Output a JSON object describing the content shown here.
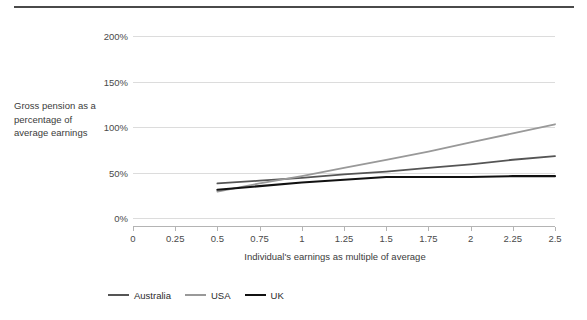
{
  "chart_data": {
    "type": "line",
    "title": "",
    "subtitle": "",
    "xlabel": "Individual's earnings as multiple of average",
    "ylabel": "Gross pension as a percentage of average earnings",
    "x": [
      0.5,
      0.75,
      1,
      1.25,
      1.5,
      1.75,
      2,
      2.25,
      2.5
    ],
    "xlim": [
      0,
      2.5
    ],
    "ylim": [
      0,
      200
    ],
    "xticks": [
      "0",
      "0.25",
      "0.5",
      "0.75",
      "1",
      "1.25",
      "1.5",
      "1.75",
      "2",
      "2.25",
      "2.5"
    ],
    "xtick_values": [
      0,
      0.25,
      0.5,
      0.75,
      1,
      1.25,
      1.5,
      1.75,
      2,
      2.25,
      2.5
    ],
    "yticks": [
      "0%",
      "50%",
      "100%",
      "150%",
      "200%"
    ],
    "ytick_values": [
      0,
      50,
      100,
      150,
      200
    ],
    "grid": true,
    "legend_position": "bottom-left",
    "series": [
      {
        "name": "Australia",
        "color": "#555555",
        "values": [
          38,
          41,
          44,
          48,
          51,
          55,
          59,
          64,
          68
        ]
      },
      {
        "name": "USA",
        "color": "#999999",
        "values": [
          29,
          38,
          46,
          55,
          64,
          73,
          83,
          93,
          103
        ]
      },
      {
        "name": "UK",
        "color": "#111111",
        "values": [
          31,
          35,
          39,
          42,
          45,
          45,
          45,
          46,
          46
        ]
      }
    ]
  },
  "axes": {
    "y_title": "Gross pension as a percentage of average earnings",
    "x_title": "Individual's earnings as multiple of average"
  },
  "legend": {
    "items": [
      {
        "label": "Australia",
        "color": "#555555"
      },
      {
        "label": "USA",
        "color": "#999999"
      },
      {
        "label": "UK",
        "color": "#111111"
      }
    ]
  }
}
